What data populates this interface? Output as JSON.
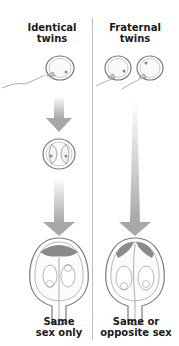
{
  "diagram": {
    "columns": [
      {
        "title_line1": "Identical",
        "title_line2": "twins",
        "stages": [
          "one egg fertilized by one sperm",
          "zygote splits into two",
          "two fetuses in shared placenta"
        ],
        "caption_line1": "Same",
        "caption_line2": "sex only"
      },
      {
        "title_line1": "Fraternal",
        "title_line2": "twins",
        "stages": [
          "two eggs each fertilized by separate sperm",
          "two fetuses with separate placentas"
        ],
        "caption_line1": "Same or",
        "caption_line2": "opposite sex"
      }
    ],
    "colors": {
      "arrow": "#a8a8a8",
      "outline": "#6b6b6b",
      "placenta": "#8a8a8a",
      "text": "#1a1a1a"
    }
  }
}
